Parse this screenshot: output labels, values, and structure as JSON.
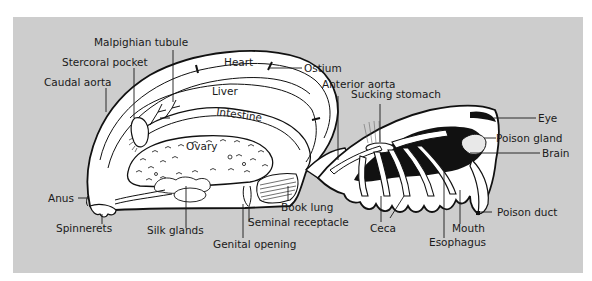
{
  "figure": {
    "background_color": "#cdcdcd",
    "line_color": "#111111"
  },
  "labels": {
    "malpighian_tubule": "Malpighian tubule",
    "stercoral_pocket": "Stercoral pocket",
    "caudal_aorta": "Caudal aorta",
    "heart": "Heart",
    "liver": "Liver",
    "intestine": "Intestine",
    "ovary": "Ovary",
    "ostium": "Ostium",
    "anterior_aorta": "Anterior aorta",
    "sucking_stomach": "Sucking stomach",
    "eye": "Eye",
    "poison_gland": "Poison gland",
    "brain": "Brain",
    "poison_duct": "Poison duct",
    "anus": "Anus",
    "spinnerets": "Spinnerets",
    "silk_glands": "Silk glands",
    "genital_opening": "Genital opening",
    "seminal_receptacle": "Seminal receptacle",
    "book_lung": "Book lung",
    "ceca": "Ceca",
    "mouth": "Mouth",
    "esophagus": "Esophagus"
  }
}
